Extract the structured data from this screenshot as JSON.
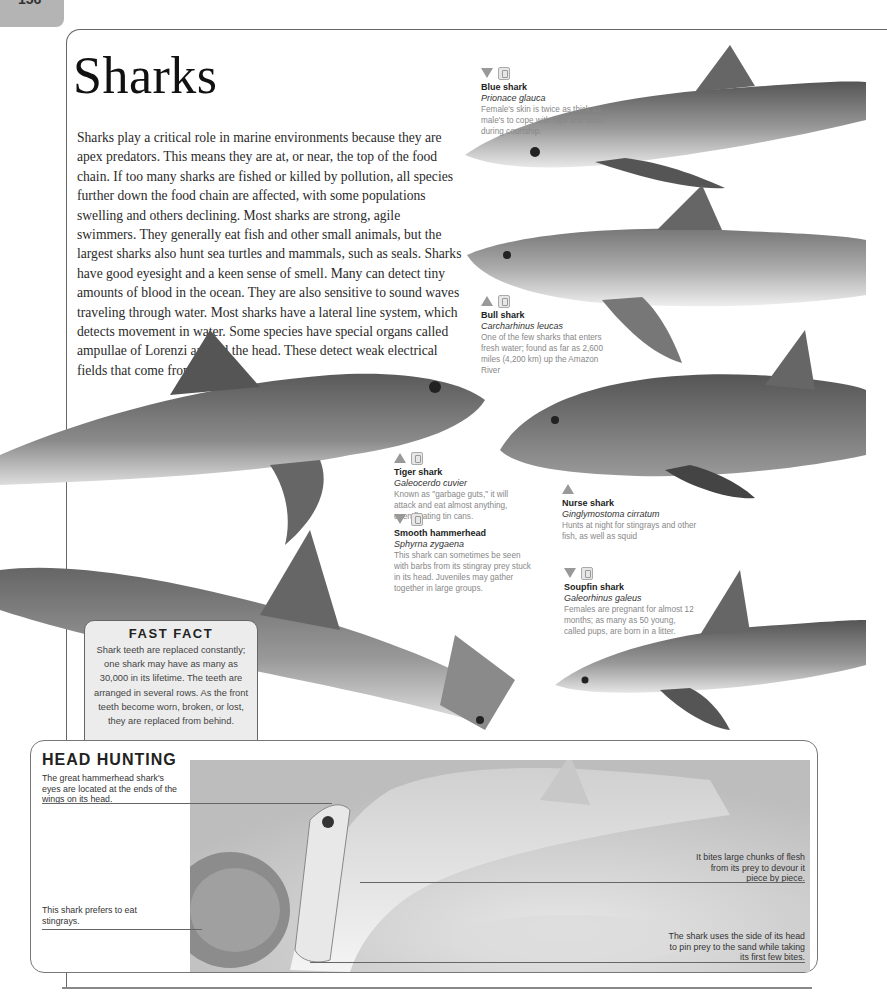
{
  "page": {
    "number": "156",
    "title": "Sharks",
    "intro": "Sharks play a critical role in marine environments because they are apex predators. This means they are at, or near, the top of the food chain. If too many sharks are fished or killed by pollution, all species further down the food chain are affected, with some populations swelling and others declining. Most sharks are strong, agile swimmers. They generally eat fish and other small animals, but the largest sharks also hunt sea turtles and mammals, such as seals. Sharks have good eyesight and a keen sense of smell. Many can detect tiny amounts of blood in the ocean. They are also sensitive to sound waves traveling through water. Most sharks have a lateral line system, which detects movement in water. Some species have special organs called ampullae of Lorenzi around the head. These detect weak electrical fields that come from prey."
  },
  "species": [
    {
      "name": "Blue shark",
      "scientific": "Prionace glauca",
      "description": "Female's skin is twice as thick as male's to cope with nips and bites during courtship.",
      "depth_icon": "triangle-down",
      "has_book_icon": true
    },
    {
      "name": "Bull shark",
      "scientific": "Carcharhinus leucas",
      "description": "One of the few sharks that enters fresh water; found as far as 2,600 miles (4,200 km) up the Amazon River",
      "depth_icon": "triangle-up",
      "has_book_icon": true
    },
    {
      "name": "Tiger shark",
      "scientific": "Galeocerdo cuvier",
      "description": "Known as \"garbage guts,\" it will attack and eat almost anything, even floating tin cans.",
      "depth_icon": "triangle-up",
      "has_book_icon": true
    },
    {
      "name": "Nurse shark",
      "scientific": "Ginglymostoma cirratum",
      "description": "Hunts at night for stingrays and other fish, as well as squid",
      "depth_icon": "triangle-up",
      "has_book_icon": false
    },
    {
      "name": "Smooth hammerhead",
      "scientific": "Sphyrna zygaena",
      "description": "This shark can sometimes be seen with barbs from its stingray prey stuck in its head. Juveniles may gather together in large groups.",
      "depth_icon": "triangle-down",
      "has_book_icon": true
    },
    {
      "name": "Soupfin shark",
      "scientific": "Galeorhinus galeus",
      "description": "Females are pregnant for almost 12 months; as many as 50 young, called pups, are born in a litter.",
      "depth_icon": "triangle-down",
      "has_book_icon": true
    }
  ],
  "fast_fact": {
    "title": "FAST FACT",
    "text": "Shark teeth are replaced constantly; one shark may have as many as 30,000 in its lifetime. The teeth are arranged in several rows. As the front teeth become worn, broken, or lost, they are replaced from behind."
  },
  "head_hunting": {
    "title": "HEAD HUNTING",
    "callouts": [
      "The great hammerhead shark's eyes are located at the ends of the wings on its head.",
      "It bites large chunks of flesh from its prey to devour it piece by piece.",
      "This shark prefers to eat stingrays.",
      "The shark uses the side of its head to pin prey to the sand while taking its first few bites."
    ]
  },
  "colors": {
    "tab_gray": "#b4b4b4",
    "fact_bg": "#ececec",
    "icon_gray": "#999999"
  }
}
